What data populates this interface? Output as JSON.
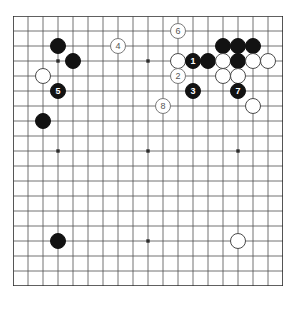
{
  "figure": {
    "name": "go-board-diagram",
    "board_size": 19,
    "colors": {
      "board_background": "#ffffff",
      "grid_line": "#4f4f4f",
      "border_line": "#2b2b2b",
      "black_stone": "#121212",
      "white_stone": "#ffffff",
      "white_stone_edge": "#4a4a4a",
      "black_label_text": "#ffffff",
      "white_label_text": "#3a3a3a"
    },
    "star_points": [
      {
        "col": 3,
        "row": 3
      },
      {
        "col": 9,
        "row": 3
      },
      {
        "col": 15,
        "row": 3
      },
      {
        "col": 3,
        "row": 9
      },
      {
        "col": 9,
        "row": 9
      },
      {
        "col": 15,
        "row": 9
      },
      {
        "col": 3,
        "row": 15
      },
      {
        "col": 9,
        "row": 15
      },
      {
        "col": 15,
        "row": 15
      }
    ]
  },
  "stones": [
    {
      "id": "b-c3",
      "color": "black",
      "label": "",
      "col": 3,
      "row": 2
    },
    {
      "id": "b-d4",
      "color": "black",
      "label": "",
      "col": 4,
      "row": 3
    },
    {
      "id": "w-c5",
      "color": "white",
      "label": "",
      "col": 2,
      "row": 4
    },
    {
      "id": "b-m5",
      "color": "black",
      "label": "5",
      "col": 3,
      "row": 5
    },
    {
      "id": "b-c8",
      "color": "black",
      "label": "",
      "col": 2,
      "row": 7
    },
    {
      "id": "w-m4",
      "color": "white",
      "label": "4",
      "col": 7,
      "row": 2
    },
    {
      "id": "w-m6",
      "color": "white",
      "label": "6",
      "col": 11,
      "row": 1
    },
    {
      "id": "w-k3",
      "color": "white",
      "label": "",
      "col": 11,
      "row": 3
    },
    {
      "id": "w-m2",
      "color": "white",
      "label": "2",
      "col": 11,
      "row": 4
    },
    {
      "id": "w-m8",
      "color": "white",
      "label": "8",
      "col": 10,
      "row": 6
    },
    {
      "id": "b-m1",
      "color": "black",
      "label": "1",
      "col": 12,
      "row": 3
    },
    {
      "id": "b-n3",
      "color": "black",
      "label": "",
      "col": 13,
      "row": 3
    },
    {
      "id": "b-o2",
      "color": "black",
      "label": "",
      "col": 14,
      "row": 2
    },
    {
      "id": "b-p2",
      "color": "black",
      "label": "",
      "col": 15,
      "row": 2
    },
    {
      "id": "b-q2",
      "color": "black",
      "label": "",
      "col": 16,
      "row": 2
    },
    {
      "id": "w-o3",
      "color": "white",
      "label": "",
      "col": 14,
      "row": 3
    },
    {
      "id": "b-p3",
      "color": "black",
      "label": "",
      "col": 15,
      "row": 3
    },
    {
      "id": "w-q3",
      "color": "white",
      "label": "",
      "col": 16,
      "row": 3
    },
    {
      "id": "w-r3",
      "color": "white",
      "label": "",
      "col": 17,
      "row": 3
    },
    {
      "id": "w-o4",
      "color": "white",
      "label": "",
      "col": 14,
      "row": 4
    },
    {
      "id": "w-p4",
      "color": "white",
      "label": "",
      "col": 15,
      "row": 4
    },
    {
      "id": "b-m3",
      "color": "black",
      "label": "3",
      "col": 12,
      "row": 5
    },
    {
      "id": "b-m7",
      "color": "black",
      "label": "7",
      "col": 15,
      "row": 5
    },
    {
      "id": "w-q7",
      "color": "white",
      "label": "",
      "col": 16,
      "row": 6
    },
    {
      "id": "b-c16",
      "color": "black",
      "label": "",
      "col": 3,
      "row": 15
    },
    {
      "id": "w-q16",
      "color": "white",
      "label": "",
      "col": 15,
      "row": 15
    }
  ]
}
